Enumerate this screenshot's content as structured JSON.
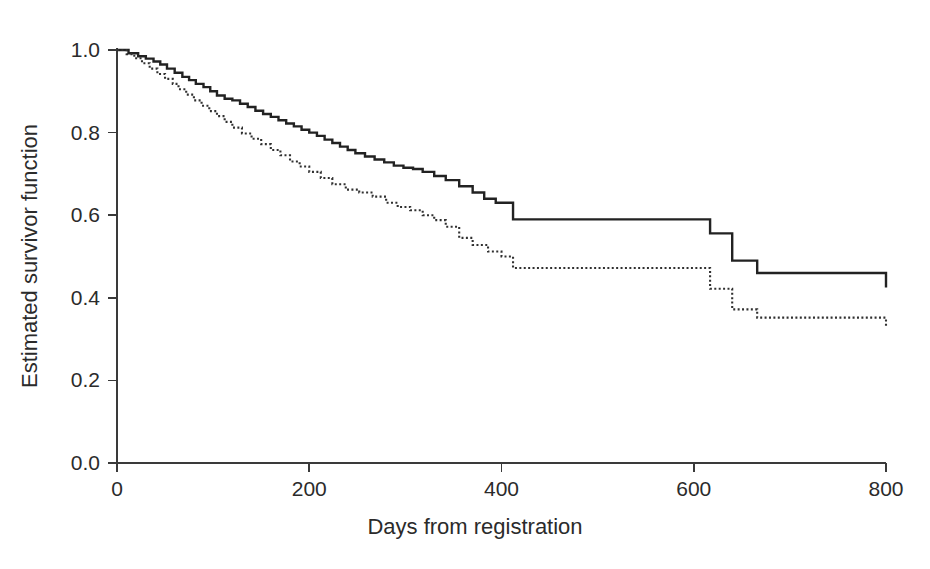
{
  "chart_data": {
    "type": "line",
    "subtype": "kaplan-meier-step",
    "title": "",
    "subtitle": "",
    "xlabel": "Days from registration",
    "ylabel": "Estimated survivor function",
    "xlim": [
      0,
      800
    ],
    "ylim": [
      0.0,
      1.0
    ],
    "xticks": [
      0,
      200,
      400,
      600,
      800
    ],
    "xtick_labels": [
      "0",
      "200",
      "400",
      "600",
      "800"
    ],
    "yticks": [
      0.0,
      0.2,
      0.4,
      0.6,
      0.8,
      1.0
    ],
    "ytick_labels": [
      "0.0",
      "0.2",
      "0.4",
      "0.6",
      "0.8",
      "1.0"
    ],
    "grid": false,
    "legend": "none",
    "colors": {
      "axis": "#3a3a3a",
      "solid_curve": "#222222",
      "dotted_curve": "#303030",
      "background": "#ffffff"
    },
    "series": [
      {
        "name": "solid-curve",
        "style": "solid",
        "x": [
          0,
          12,
          22,
          30,
          38,
          45,
          52,
          60,
          68,
          75,
          82,
          90,
          97,
          104,
          112,
          120,
          128,
          136,
          144,
          152,
          160,
          168,
          176,
          184,
          192,
          200,
          208,
          216,
          224,
          232,
          240,
          248,
          258,
          268,
          278,
          288,
          298,
          308,
          318,
          330,
          342,
          356,
          370,
          382,
          394,
          412,
          617,
          640,
          666,
          800
        ],
        "y": [
          1.0,
          0.992,
          0.985,
          0.979,
          0.972,
          0.965,
          0.955,
          0.945,
          0.935,
          0.927,
          0.918,
          0.91,
          0.9,
          0.89,
          0.882,
          0.878,
          0.87,
          0.862,
          0.853,
          0.845,
          0.838,
          0.83,
          0.822,
          0.815,
          0.807,
          0.8,
          0.792,
          0.783,
          0.775,
          0.766,
          0.758,
          0.75,
          0.742,
          0.735,
          0.728,
          0.72,
          0.715,
          0.712,
          0.705,
          0.695,
          0.685,
          0.67,
          0.655,
          0.64,
          0.63,
          0.59,
          0.556,
          0.49,
          0.46,
          0.425
        ],
        "final_value": 0.425
      },
      {
        "name": "dotted-curve",
        "style": "dotted",
        "x": [
          0,
          10,
          18,
          26,
          34,
          42,
          50,
          58,
          64,
          72,
          80,
          88,
          96,
          104,
          112,
          120,
          130,
          140,
          150,
          160,
          170,
          180,
          190,
          200,
          212,
          224,
          238,
          252,
          266,
          280,
          292,
          305,
          318,
          330,
          342,
          356,
          370,
          386,
          400,
          412,
          617,
          640,
          666,
          800
        ],
        "y": [
          1.0,
          0.99,
          0.98,
          0.968,
          0.955,
          0.942,
          0.93,
          0.918,
          0.905,
          0.892,
          0.878,
          0.865,
          0.852,
          0.84,
          0.826,
          0.812,
          0.798,
          0.785,
          0.772,
          0.758,
          0.745,
          0.73,
          0.718,
          0.705,
          0.69,
          0.675,
          0.662,
          0.655,
          0.645,
          0.63,
          0.62,
          0.612,
          0.6,
          0.588,
          0.572,
          0.545,
          0.528,
          0.512,
          0.5,
          0.472,
          0.422,
          0.372,
          0.352,
          0.328
        ],
        "final_value": 0.328
      }
    ],
    "annotations": []
  },
  "axes": {
    "x_title": "Days from registration",
    "y_title": "Estimated survivor function"
  }
}
